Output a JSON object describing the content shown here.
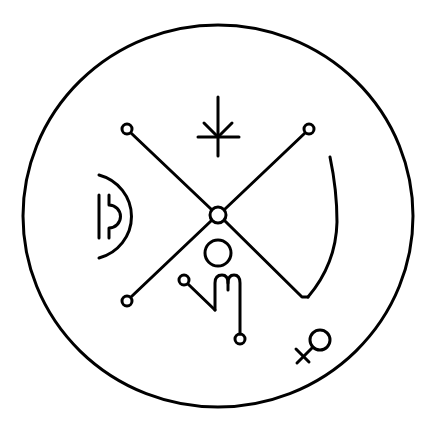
{
  "figure": {
    "description": "Sigil: outer circle enclosing an X-shaped cross with terminal rings and astrological glyphs",
    "background": "#ffffff",
    "ink": "#000000",
    "stroke_width": 3
  },
  "elements": {
    "outer_circle": {
      "cx": 218,
      "cy": 216,
      "rx": 195,
      "ry": 191
    },
    "cross": {
      "center": {
        "cx": 218,
        "cy": 215,
        "r": 9
      },
      "arms": [
        {
          "name": "upper-left",
          "end_ring": {
            "cx": 127,
            "cy": 129,
            "r": 5
          }
        },
        {
          "name": "upper-right",
          "end_ring": {
            "cx": 309,
            "cy": 129,
            "r": 5
          }
        },
        {
          "name": "lower-left",
          "end_ring": {
            "cx": 127,
            "cy": 301,
            "r": 5
          }
        },
        {
          "name": "lower-right",
          "end_point": {
            "x": 305,
            "y": 302
          }
        }
      ]
    },
    "glyphs": [
      {
        "name": "star-asterisk",
        "position": "top-center"
      },
      {
        "name": "moon-half-circle",
        "position": "left"
      },
      {
        "name": "crescent-arc",
        "position": "right"
      },
      {
        "name": "head-circle",
        "position": "below-center"
      },
      {
        "name": "scorpio-like-m",
        "position": "lower-center"
      },
      {
        "name": "venus-symbol",
        "position": "bottom-right"
      }
    ]
  }
}
